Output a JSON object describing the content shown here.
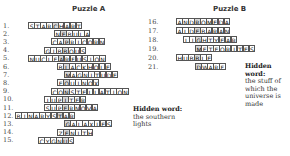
{
  "puzzle_a": {
    "title": "Puzzle A",
    "hidden_word_label": "Hidden word:",
    "hidden_word_clue": [
      "the southern",
      "lights"
    ],
    "rows": [
      {
        "num": "1.",
        "word": "STARCHART",
        "x": 29,
        "hl": 4
      },
      {
        "num": "2.",
        "word": "NEBULA",
        "x": 55,
        "hl": 1
      },
      {
        "num": "3.",
        "word": "CAPRICORN",
        "x": 52,
        "hl": 2
      },
      {
        "num": "4.",
        "word": "GIBBOUS",
        "x": 45,
        "hl": 3
      },
      {
        "num": "5.",
        "word": "NUCLEARFUSION",
        "x": 29,
        "hl": 5
      },
      {
        "num": "6.",
        "word": "BLACKHOLE",
        "x": 58,
        "hl": 1
      },
      {
        "num": "7.",
        "word": "MAGNITUDE",
        "x": 65,
        "hl": 0
      },
      {
        "num": "8.",
        "word": "EQUINOX",
        "x": 58,
        "hl": 1
      },
      {
        "num": "9.",
        "word": "CONSTELLATION",
        "x": 52,
        "hl": 2
      },
      {
        "num": "10.",
        "word": "JUPITER",
        "x": 45,
        "hl": 3
      },
      {
        "num": "11.",
        "word": "SUPERNOVA",
        "x": 45,
        "hl": 3
      },
      {
        "num": "12.",
        "word": "BINARYSTAR",
        "x": 16,
        "hl": 7
      },
      {
        "num": "13.",
        "word": "GALAXIES",
        "x": 65,
        "hl": 0
      },
      {
        "num": "14.",
        "word": "ZENITH",
        "x": 58,
        "hl": 1
      },
      {
        "num": "15.",
        "word": "CYGNUS",
        "x": 39,
        "hl": 4
      }
    ]
  },
  "puzzle_b": {
    "title": "Puzzle B",
    "hidden_word_label": "Hidden word:",
    "hidden_word_clue": [
      "the stuff of",
      "which the",
      "universe is",
      "made"
    ],
    "rows": [
      {
        "num": "16.",
        "word": "ANDROMEDA",
        "x": 177,
        "hl": 3
      },
      {
        "num": "17.",
        "word": "ALDEBARAN",
        "x": 177,
        "hl": 3
      },
      {
        "num": "18.",
        "word": "LIGHTYEAR",
        "x": 184,
        "hl": 2
      },
      {
        "num": "19.",
        "word": "METEORITES",
        "x": 196,
        "hl": 0
      },
      {
        "num": "20.",
        "word": "HUBBLE",
        "x": 177,
        "hl": 3
      },
      {
        "num": "21.",
        "word": "DWARF",
        "x": 196,
        "hl": 0
      }
    ]
  }
}
